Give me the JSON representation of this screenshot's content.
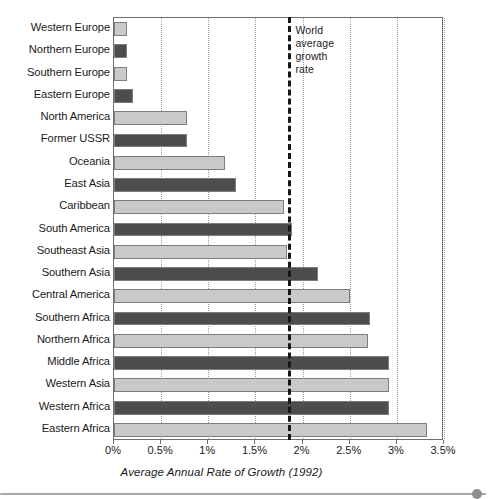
{
  "chart_data": {
    "type": "bar",
    "orientation": "horizontal",
    "title": "",
    "subtitle": "",
    "xlabel": "Average Annual Rate of Growth (1992)",
    "ylabel": "",
    "xlim": [
      0,
      3.5
    ],
    "xtick_labels": [
      "0%",
      "0.5%",
      "1%",
      "1.5%",
      "2%",
      "2.5%",
      "3%",
      "3.5%"
    ],
    "xtick_values": [
      0,
      0.5,
      1,
      1.5,
      2,
      2.5,
      3,
      3.5
    ],
    "grid": "vertical-dotted",
    "legend": "none",
    "unit": "percent",
    "categories": [
      "Western Europe",
      "Northern Europe",
      "Southern Europe",
      "Eastern Europe",
      "North America",
      "Former USSR",
      "Oceania",
      "East Asia",
      "Caribbean",
      "South America",
      "Southeast Asia",
      "Southern Asia",
      "Central America",
      "Southern Africa",
      "Northern Africa",
      "Middle Africa",
      "Western Asia",
      "Western Africa",
      "Eastern Africa"
    ],
    "values": [
      0.14,
      0.14,
      0.14,
      0.2,
      0.77,
      0.77,
      1.18,
      1.29,
      1.8,
      1.89,
      1.84,
      2.16,
      2.5,
      2.72,
      2.69,
      2.92,
      2.92,
      2.92,
      3.32
    ],
    "bar_colors": [
      "#c9c9c9",
      "#4d4d4d",
      "#c9c9c9",
      "#4d4d4d",
      "#c9c9c9",
      "#4d4d4d",
      "#c9c9c9",
      "#4d4d4d",
      "#c9c9c9",
      "#4d4d4d",
      "#c9c9c9",
      "#4d4d4d",
      "#c9c9c9",
      "#4d4d4d",
      "#c9c9c9",
      "#4d4d4d",
      "#c9c9c9",
      "#4d4d4d",
      "#c9c9c9"
    ],
    "annotations": [
      {
        "name": "world-average-growth-rate",
        "value": 1.85,
        "style": "dashed-vertical-line",
        "color": "#161616",
        "label_lines": [
          "World",
          "average",
          "growth",
          "rate"
        ]
      }
    ]
  },
  "colors": {
    "light_bar": "#c9c9c9",
    "dark_bar": "#4d4d4d",
    "bar_outline": "#7d7d7d",
    "axis": "#6f6f6f",
    "gridline": "#9a9a9a",
    "annotation_line": "#161616",
    "footer_rule": "#a8a8a8",
    "footer_dot": "#8e8e8e"
  }
}
